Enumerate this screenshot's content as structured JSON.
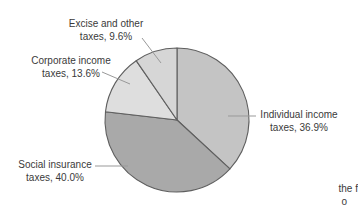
{
  "chart_data": {
    "type": "pie",
    "categories": [
      "Individual income taxes",
      "Social insurance taxes",
      "Corporate income taxes",
      "Excise and other taxes"
    ],
    "values": [
      36.9,
      40.0,
      13.6,
      9.6
    ],
    "slice_colors": [
      "#c4c4c4",
      "#a9a9a9",
      "#dedede",
      "#d6d6d6"
    ],
    "start_angle": "12-oclock",
    "direction": "clockwise",
    "legend_position": "none",
    "callouts": [
      {
        "line1": "Individual income",
        "line2": "taxes, 36.9%"
      },
      {
        "line1": "Social insurance",
        "line2": "taxes, 40.0%"
      },
      {
        "line1": "Corporate income",
        "line2": "taxes, 13.6%"
      },
      {
        "line1": "Excise and other",
        "line2": "taxes, 9.6%"
      }
    ]
  },
  "partial_text": {
    "line1": "the f",
    "line2": "o"
  },
  "colors": {
    "background": "#ffffff",
    "slice_stroke": "#5f5f5f",
    "leader_line": "#999999",
    "label_text": "#3a3a3a"
  }
}
